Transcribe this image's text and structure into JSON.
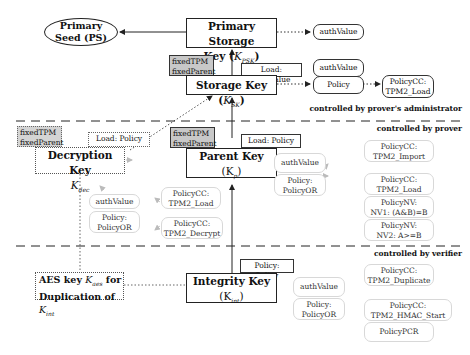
{
  "primary_seed": {
    "line1": "Primary",
    "line2": "Seed (PS)"
  },
  "psk": {
    "line1": "Primary Storage",
    "line2": "Key (",
    "sym": "K",
    "sub": "PSK",
    "close": ")",
    "auth": "authValue"
  },
  "sk": {
    "title": "Storage Key (",
    "sym": "K",
    "sub": "SK",
    "close": ")",
    "attrs": [
      "fixedTPM",
      "fixedParent"
    ],
    "load_label": "Load: authValue",
    "auth": "authValue",
    "policy": "Policy",
    "policy_cc": [
      "PolicyCC:",
      "TPM2_Load"
    ]
  },
  "zones": {
    "admin": "controlled by prover's administrator",
    "prover": "controlled by prover",
    "verifier": "controlled by verifier"
  },
  "parent_key": {
    "title": "Parent Key",
    "sym": "(K",
    "sub": "p",
    "close": ")",
    "attrs": [
      "fixedTPM",
      "fixedParent"
    ],
    "load_label": "Load: Policy",
    "auth": "authValue",
    "policy": [
      "Policy:",
      "PolicyOR"
    ],
    "branches": [
      [
        "PolicyCC:",
        "TPM2_Import"
      ],
      [
        "PolicyCC:",
        "TPM2_Load"
      ],
      [
        "PolicyNV:",
        "NV1: (A&B)=B"
      ],
      [
        "PolicyNV:",
        "NV2: A>=B"
      ]
    ]
  },
  "decryption_key": {
    "title": "Decryption Key",
    "sym": "K",
    "sub": "dec",
    "attrs": [
      "fixedTPM",
      "fixedParent"
    ],
    "load_label": "Load: Policy",
    "auth": "authValue",
    "policy": [
      "Policy:",
      "PolicyOR"
    ],
    "branches": [
      [
        "PolicyCC:",
        "TPM2_Load"
      ],
      [
        "PolicyCC:",
        "TPM2_Decrypt"
      ]
    ]
  },
  "integrity_key": {
    "title": "Integrity Key",
    "sym": "(K",
    "sub": "int",
    "close": ")",
    "load_label": "Policy: Policy",
    "auth": "authValue",
    "policy": [
      "Policy:",
      "PolicyOR"
    ],
    "branches": [
      [
        "PolicyCC:",
        "TPM2_Duplicate"
      ],
      [
        "PolicyCC:",
        "TPM2_HMAC_Start"
      ],
      [
        "PolicyPCR"
      ]
    ]
  },
  "aes_key": {
    "line1a": "AES key ",
    "sym": "K",
    "sub": "aes",
    "line1b": " for",
    "line2a": "Duplication of ",
    "sym2": "K",
    "sub2": "int"
  }
}
